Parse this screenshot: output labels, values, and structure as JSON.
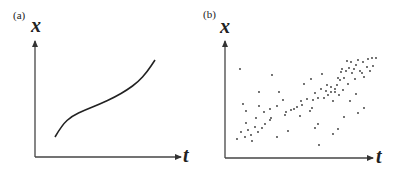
{
  "panels": [
    {
      "label": "(a)",
      "type": "curve",
      "y_axis_label": "x",
      "x_axis_label": "t",
      "curve_points": [
        [
          55,
          137
        ],
        [
          62,
          125
        ],
        [
          72,
          116
        ],
        [
          85,
          110
        ],
        [
          100,
          104
        ],
        [
          115,
          97
        ],
        [
          127,
          90
        ],
        [
          138,
          82
        ],
        [
          147,
          72
        ],
        [
          155,
          60
        ]
      ]
    },
    {
      "label": "(b)",
      "type": "scatter",
      "y_axis_label": "x",
      "x_axis_label": "t",
      "scatter_points": [
        [
          237,
          139
        ],
        [
          245,
          137
        ],
        [
          252,
          141
        ],
        [
          241,
          132
        ],
        [
          248,
          130
        ],
        [
          258,
          132
        ],
        [
          255,
          127
        ],
        [
          262,
          128
        ],
        [
          251,
          135
        ],
        [
          265,
          124
        ],
        [
          270,
          120
        ],
        [
          256,
          118
        ],
        [
          264,
          112
        ],
        [
          246,
          123
        ],
        [
          243,
          104
        ],
        [
          246,
          111
        ],
        [
          259,
          106
        ],
        [
          259,
          92
        ],
        [
          272,
          75
        ],
        [
          279,
          92
        ],
        [
          270,
          109
        ],
        [
          277,
          106
        ],
        [
          283,
          100
        ],
        [
          285,
          115
        ],
        [
          288,
          131
        ],
        [
          277,
          137
        ],
        [
          271,
          118
        ],
        [
          286,
          112
        ],
        [
          291,
          110
        ],
        [
          294,
          109
        ],
        [
          297,
          107
        ],
        [
          300,
          116
        ],
        [
          302,
          105
        ],
        [
          304,
          84
        ],
        [
          301,
          101
        ],
        [
          307,
          99
        ],
        [
          310,
          111
        ],
        [
          313,
          100
        ],
        [
          315,
          93
        ],
        [
          318,
          98
        ],
        [
          318,
          124
        ],
        [
          321,
          89
        ],
        [
          324,
          98
        ],
        [
          326,
          91
        ],
        [
          328,
          95
        ],
        [
          331,
          87
        ],
        [
          333,
          101
        ],
        [
          335,
          89
        ],
        [
          337,
          85
        ],
        [
          339,
          95
        ],
        [
          340,
          80
        ],
        [
          343,
          90
        ],
        [
          344,
          117
        ],
        [
          346,
          71
        ],
        [
          348,
          84
        ],
        [
          311,
          79
        ],
        [
          312,
          108
        ],
        [
          315,
          128
        ],
        [
          319,
          145
        ],
        [
          322,
          74
        ],
        [
          327,
          85
        ],
        [
          331,
          92
        ],
        [
          335,
          92
        ],
        [
          338,
          78
        ],
        [
          341,
          72
        ],
        [
          342,
          69
        ],
        [
          344,
          78
        ],
        [
          347,
          61
        ],
        [
          349,
          68
        ],
        [
          351,
          62
        ],
        [
          352,
          73
        ],
        [
          354,
          69
        ],
        [
          355,
          79
        ],
        [
          356,
          65
        ],
        [
          358,
          60
        ],
        [
          360,
          71
        ],
        [
          362,
          73
        ],
        [
          363,
          62
        ],
        [
          367,
          67
        ],
        [
          368,
          59
        ],
        [
          370,
          71
        ],
        [
          372,
          58
        ],
        [
          373,
          66
        ],
        [
          376,
          58
        ],
        [
          350,
          101
        ],
        [
          358,
          113
        ],
        [
          356,
          94
        ],
        [
          364,
          108
        ],
        [
          364,
          77
        ],
        [
          338,
          129
        ],
        [
          333,
          134
        ],
        [
          240,
          69
        ]
      ]
    }
  ],
  "chart_data": {
    "type": "scatter",
    "title": "",
    "panels": [
      {
        "label": "(a)",
        "kind": "smooth monotonic S-curve",
        "xlabel": "t",
        "ylabel": "x"
      },
      {
        "label": "(b)",
        "kind": "noisy scatter with upward trend",
        "xlabel": "t",
        "ylabel": "x"
      }
    ],
    "grid": false
  }
}
